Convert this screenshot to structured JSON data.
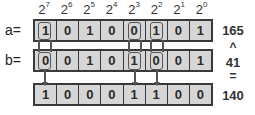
{
  "powers": [
    {
      "base": "2",
      "exp": "7"
    },
    {
      "base": "2",
      "exp": "6"
    },
    {
      "base": "2",
      "exp": "5"
    },
    {
      "base": "2",
      "exp": "4"
    },
    {
      "base": "2",
      "exp": "3"
    },
    {
      "base": "2",
      "exp": "2"
    },
    {
      "base": "2",
      "exp": "1"
    },
    {
      "base": "2",
      "exp": "0"
    }
  ],
  "rows": {
    "a": {
      "label": "a=",
      "bits": [
        "1",
        "0",
        "1",
        "0",
        "0",
        "1",
        "0",
        "1"
      ],
      "value": "165"
    },
    "b": {
      "label": "b=",
      "bits": [
        "0",
        "0",
        "1",
        "0",
        "1",
        "0",
        "0",
        "1"
      ],
      "value": "41"
    },
    "result": {
      "bits": [
        "1",
        "0",
        "0",
        "0",
        "1",
        "1",
        "0",
        "0"
      ],
      "value": "140"
    }
  },
  "operators": {
    "xor": "^",
    "equals": "="
  },
  "highlighted_bit_positions": [
    7,
    3,
    2
  ]
}
